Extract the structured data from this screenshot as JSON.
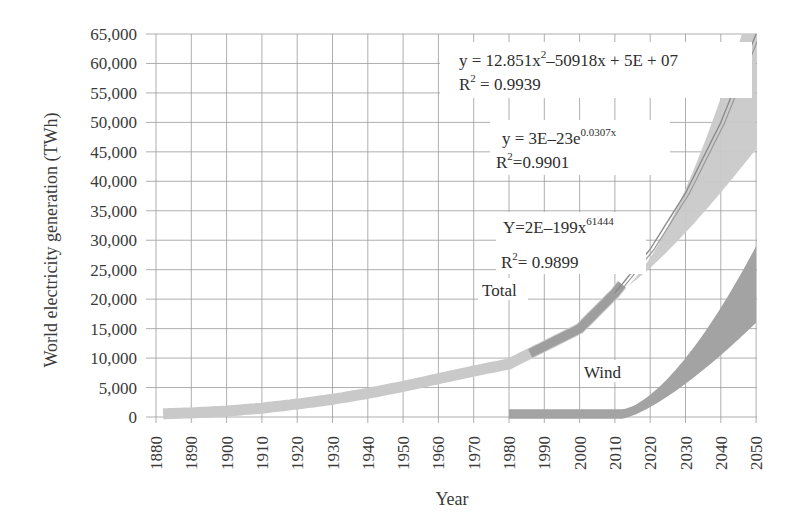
{
  "chart_data": {
    "type": "area",
    "title": "",
    "xlabel": "Year",
    "ylabel": "World electricity generation (TWh)",
    "xlim": [
      1880,
      2050
    ],
    "ylim": [
      0,
      65000
    ],
    "grid": true,
    "legend": "none (inline labels)",
    "x_ticks": [
      "1880",
      "1890",
      "1900",
      "1910",
      "1920",
      "1930",
      "1940",
      "1950",
      "1960",
      "1970",
      "1980",
      "1990",
      "2000",
      "2010",
      "2020",
      "2030",
      "2040",
      "2050"
    ],
    "y_ticks": [
      "0",
      "5,000",
      "10,000",
      "15,000",
      "20,000",
      "25,000",
      "30,000",
      "35,000",
      "40,000",
      "45,000",
      "50,000",
      "55,000",
      "60,000",
      "65,000"
    ],
    "series": [
      {
        "name": "Total",
        "x": [
          1880,
          1890,
          1900,
          1910,
          1920,
          1930,
          1940,
          1950,
          1960,
          1970,
          1980,
          1990,
          2000,
          2010,
          2020,
          2030,
          2040,
          2050
        ],
        "values": [
          500,
          700,
          1000,
          1500,
          2200,
          3000,
          4000,
          5200,
          6500,
          7800,
          9000,
          12000,
          15000,
          21000,
          28500,
          38000,
          50000,
          65000
        ],
        "band_upper_2050": 65000,
        "band_lower_2050": 45500
      },
      {
        "name": "Wind",
        "x": [
          1980,
          1990,
          2000,
          2010,
          2020,
          2030,
          2040,
          2050
        ],
        "values": [
          500,
          500,
          500,
          600,
          3000,
          9000,
          15000,
          22000
        ],
        "band_upper_2050": 29000,
        "band_lower_2050": 16000
      }
    ],
    "annotations": [
      {
        "text": "y = 12.851x² − 50918x + 5E + 07",
        "r2": "R² = 0.9939"
      },
      {
        "text": "y = 3E−23e^0.0307x",
        "r2": "R²=0.9901"
      },
      {
        "text": "Y=2E−199x^61444",
        "r2": "R²= 0.9899"
      }
    ]
  },
  "labels": {
    "ylabel": "World electricity generation (TWh)",
    "xlabel": "Year",
    "total": "Total",
    "wind": "Wind",
    "eq1_main": "y = 12.851x",
    "eq1_sup": "2",
    "eq1_rest": "–50918x + 5E + 07",
    "eq1_r2_pre": "R",
    "eq1_r2_sup": "2",
    "eq1_r2_val": " = 0.9939",
    "eq2_main": "y = 3E–23e",
    "eq2_sup": "0.0307x",
    "eq2_r2_pre": "R",
    "eq2_r2_sup": "2",
    "eq2_r2_val": "=0.9901",
    "eq3_main": "Y=2E–199x",
    "eq3_sup": "61444",
    "eq3_r2_pre": "R",
    "eq3_r2_sup": "2",
    "eq3_r2_val": "= 0.9899"
  },
  "colors": {
    "grid": "#9a9a9a",
    "total_band_light": "#c9c9c9",
    "total_band_dark": "#9e9e9e",
    "wind_band": "#a3a3a3",
    "text": "#333333"
  }
}
